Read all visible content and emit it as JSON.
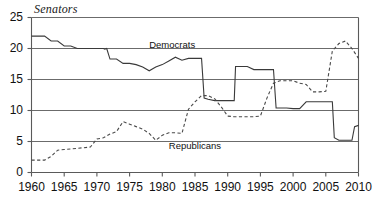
{
  "chart_data": {
    "type": "line",
    "title": "Senators",
    "xlabel": "",
    "ylabel": "",
    "xlim": [
      1960,
      2010
    ],
    "ylim": [
      0,
      25
    ],
    "grid": true,
    "gridlines_y": [
      5,
      10,
      15,
      20,
      25
    ],
    "legend_position": "inline-annotation",
    "x_ticks": [
      1960,
      1965,
      1970,
      1975,
      1980,
      1985,
      1990,
      1995,
      2000,
      2005,
      2010
    ],
    "y_ticks": [
      0,
      5,
      10,
      15,
      20,
      25
    ],
    "annotations": [
      {
        "text": "Democrats",
        "x": 1978,
        "y": 20.6
      },
      {
        "text": "Republicans",
        "x": 1981,
        "y": 4.2
      }
    ],
    "series": [
      {
        "name": "Democrats",
        "style": "solid",
        "color": "#3a3a3a",
        "points": [
          [
            1960,
            22
          ],
          [
            1961,
            22
          ],
          [
            1962,
            22
          ],
          [
            1963,
            21
          ],
          [
            1964,
            21
          ],
          [
            1965,
            20.4
          ],
          [
            1966,
            20.4
          ],
          [
            1967,
            20
          ],
          [
            1968,
            20
          ],
          [
            1969,
            20
          ],
          [
            1970,
            20
          ],
          [
            1971,
            20
          ],
          [
            1972,
            20
          ],
          [
            1973,
            20
          ],
          [
            1974,
            20
          ],
          [
            1975,
            20
          ],
          [
            1976,
            20
          ],
          [
            1977,
            20
          ],
          [
            1978,
            20
          ],
          [
            1979,
            20
          ],
          [
            1980,
            20
          ],
          [
            1981,
            20
          ],
          [
            1982,
            20
          ],
          [
            1983,
            20
          ],
          [
            1984,
            20
          ],
          [
            1985,
            20
          ],
          [
            1986,
            20
          ],
          [
            1987,
            20
          ],
          [
            1988,
            20
          ],
          [
            1989,
            20
          ],
          [
            1990,
            20
          ],
          [
            1991,
            20
          ],
          [
            1992,
            20
          ],
          [
            1993,
            20
          ],
          [
            1994,
            20
          ],
          [
            1995,
            20
          ],
          [
            1996,
            20
          ],
          [
            1997,
            20
          ],
          [
            1998,
            20
          ],
          [
            1999,
            20
          ],
          [
            2000,
            20
          ],
          [
            2001,
            20
          ],
          [
            2002,
            20
          ],
          [
            2003,
            20
          ],
          [
            2004,
            20
          ],
          [
            2005,
            20
          ],
          [
            2006,
            20
          ],
          [
            2007,
            20
          ],
          [
            2008,
            20
          ],
          [
            2009,
            20
          ],
          [
            2010,
            20
          ]
        ],
        "path": [
          [
            1960,
            22
          ],
          [
            1962,
            22
          ],
          [
            1963,
            21.2
          ],
          [
            1964,
            21.2
          ],
          [
            1965,
            20.4
          ],
          [
            1966,
            20.4
          ],
          [
            1967,
            20
          ],
          [
            1970,
            20
          ],
          [
            1971,
            20
          ],
          [
            1971.2,
            19.9
          ],
          [
            1971.5,
            20
          ],
          [
            1972,
            18.3
          ],
          [
            1973,
            18.3
          ],
          [
            1974,
            17.6
          ],
          [
            1975,
            17.6
          ],
          [
            1976,
            17.4
          ],
          [
            1977,
            17
          ],
          [
            1978,
            16.4
          ],
          [
            1979,
            17
          ],
          [
            1980,
            17.4
          ],
          [
            1981,
            18
          ],
          [
            1982,
            18.6
          ],
          [
            1983,
            18.1
          ],
          [
            1984,
            18.4
          ],
          [
            1985,
            18.4
          ],
          [
            1986,
            18.4
          ],
          [
            1986.4,
            12
          ],
          [
            1987,
            11.8
          ],
          [
            1988,
            11.6
          ],
          [
            1989,
            11.6
          ],
          [
            1990,
            11.6
          ],
          [
            1991,
            11.6
          ],
          [
            1991.2,
            17.1
          ],
          [
            1992,
            17.1
          ],
          [
            1993,
            17.1
          ],
          [
            1994,
            16.6
          ],
          [
            1995,
            16.6
          ],
          [
            1996,
            16.6
          ],
          [
            1997,
            16.6
          ],
          [
            1997.4,
            10.4
          ],
          [
            1998,
            10.4
          ],
          [
            1999,
            10.4
          ],
          [
            2000,
            10.3
          ],
          [
            2001,
            10.3
          ],
          [
            2002,
            11.4
          ],
          [
            2003,
            11.4
          ],
          [
            2004,
            11.4
          ],
          [
            2005,
            11.4
          ],
          [
            2006,
            11.4
          ],
          [
            2006.3,
            5.6
          ],
          [
            2007,
            5.2
          ],
          [
            2008,
            5.2
          ],
          [
            2009,
            5.2
          ],
          [
            2009.4,
            7.4
          ],
          [
            2010,
            7.6
          ]
        ]
      },
      {
        "name": "Republicans",
        "style": "dashed",
        "color": "#4a4a4a",
        "path": [
          [
            1960,
            2
          ],
          [
            1961,
            2
          ],
          [
            1962,
            2
          ],
          [
            1963,
            2.6
          ],
          [
            1964,
            3.6
          ],
          [
            1965,
            3.7
          ],
          [
            1966,
            3.8
          ],
          [
            1967,
            3.9
          ],
          [
            1968,
            4
          ],
          [
            1969,
            4.1
          ],
          [
            1970,
            5.4
          ],
          [
            1971,
            5.6
          ],
          [
            1972,
            6.2
          ],
          [
            1973,
            6.6
          ],
          [
            1974,
            8.2
          ],
          [
            1975,
            7.8
          ],
          [
            1976,
            7.4
          ],
          [
            1977,
            7
          ],
          [
            1978,
            6.3
          ],
          [
            1979,
            5.2
          ],
          [
            1980,
            6
          ],
          [
            1981,
            6.4
          ],
          [
            1982,
            6.4
          ],
          [
            1983,
            6.3
          ],
          [
            1984,
            10.2
          ],
          [
            1985,
            11.4
          ],
          [
            1986,
            12.4
          ],
          [
            1987,
            12.4
          ],
          [
            1988,
            11.9
          ],
          [
            1989,
            10.6
          ],
          [
            1990,
            9.1
          ],
          [
            1991,
            9
          ],
          [
            1992,
            9
          ],
          [
            1993,
            9
          ],
          [
            1994,
            9
          ],
          [
            1995,
            9.1
          ],
          [
            1996,
            12
          ],
          [
            1997,
            14.4
          ],
          [
            1998,
            14.8
          ],
          [
            1999,
            14.8
          ],
          [
            2000,
            14.8
          ],
          [
            2001,
            14.4
          ],
          [
            2002,
            14.2
          ],
          [
            2003,
            13
          ],
          [
            2004,
            13
          ],
          [
            2005,
            13.1
          ],
          [
            2006,
            19.6
          ],
          [
            2007,
            20.8
          ],
          [
            2008,
            21.2
          ],
          [
            2009,
            20
          ],
          [
            2010,
            18.4
          ]
        ]
      }
    ]
  }
}
